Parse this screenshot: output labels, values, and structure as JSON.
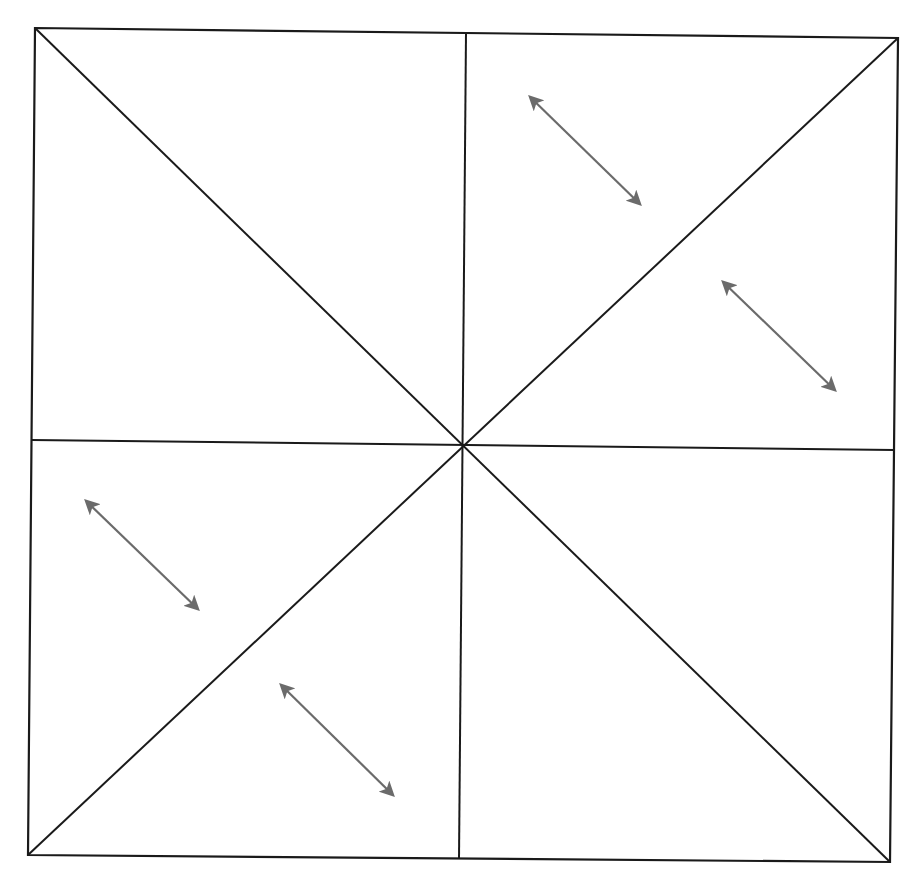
{
  "diagram": {
    "title": "",
    "canvas": {
      "width": 923,
      "height": 891,
      "background": "#ffffff"
    },
    "colors": {
      "line": "#1a1a1a",
      "arrow": "#6b6b6b"
    },
    "square": {
      "top_left": [
        35,
        28
      ],
      "top_right": [
        898,
        38
      ],
      "bottom_right": [
        890,
        862
      ],
      "bottom_left": [
        28,
        855
      ]
    },
    "center": [
      462,
      446
    ],
    "midpoints": {
      "top": [
        466,
        33
      ],
      "bottom": [
        459,
        859
      ],
      "left": [
        32,
        440
      ],
      "right": [
        894,
        450
      ]
    },
    "fold_lines": [
      {
        "name": "diagonal-tl-br",
        "from": [
          35,
          28
        ],
        "to": [
          890,
          862
        ]
      },
      {
        "name": "diagonal-tr-bl",
        "from": [
          898,
          38
        ],
        "to": [
          28,
          855
        ]
      },
      {
        "name": "vertical-midline",
        "from": [
          466,
          33
        ],
        "to": [
          459,
          859
        ]
      },
      {
        "name": "horizontal-midline",
        "from": [
          32,
          440
        ],
        "to": [
          894,
          450
        ]
      }
    ],
    "arrows": [
      {
        "name": "arrow-top-right-upper",
        "from": [
          528,
          95
        ],
        "to": [
          642,
          206
        ],
        "type": "double-headed"
      },
      {
        "name": "arrow-top-right-lower",
        "from": [
          721,
          280
        ],
        "to": [
          837,
          392
        ],
        "type": "double-headed"
      },
      {
        "name": "arrow-bottom-left-upper",
        "from": [
          84,
          499
        ],
        "to": [
          200,
          611
        ],
        "type": "double-headed"
      },
      {
        "name": "arrow-bottom-left-lower",
        "from": [
          279,
          683
        ],
        "to": [
          395,
          797
        ],
        "type": "double-headed"
      }
    ]
  }
}
